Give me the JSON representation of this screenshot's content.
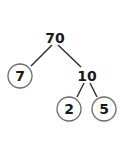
{
  "diagram": {
    "type": "factor-tree",
    "root": {
      "value": "70"
    },
    "nodes": [
      {
        "id": "n70",
        "value": "70",
        "circled": false,
        "x": 55,
        "y": 38
      },
      {
        "id": "n7",
        "value": "7",
        "circled": true,
        "x": 20,
        "y": 76
      },
      {
        "id": "n10",
        "value": "10",
        "circled": false,
        "x": 87,
        "y": 76
      },
      {
        "id": "n2",
        "value": "2",
        "circled": true,
        "x": 69,
        "y": 109
      },
      {
        "id": "n5",
        "value": "5",
        "circled": true,
        "x": 104,
        "y": 109
      }
    ],
    "edges": [
      {
        "from": "70",
        "to": "7"
      },
      {
        "from": "70",
        "to": "10"
      },
      {
        "from": "10",
        "to": "2"
      },
      {
        "from": "10",
        "to": "5"
      }
    ],
    "colors": {
      "text": "#1a1a1a",
      "edge": "#2a2a2a",
      "circle_stroke": "#6b6b6b",
      "background": "#ffffff"
    }
  }
}
